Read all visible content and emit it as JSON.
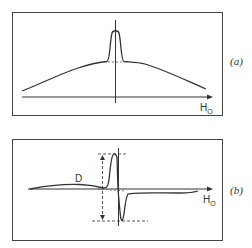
{
  "figure": {
    "panels": [
      {
        "id": "a",
        "label": "(a)",
        "x_axis_label": "H",
        "x_axis_subscript": "O",
        "description": "Broad absorption background with narrow central peak"
      },
      {
        "id": "b",
        "label": "(b)",
        "x_axis_label": "H",
        "x_axis_subscript": "O",
        "curve_label": "D",
        "description": "Derivative signal with dashed amplitude markers"
      }
    ],
    "colors": {
      "line": "#333333",
      "frame": "#444444",
      "background": "#ffffff"
    }
  }
}
